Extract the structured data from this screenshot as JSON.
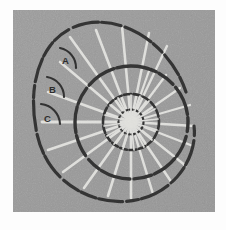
{
  "figure": {
    "kind": "scientific-line-figure",
    "canvas": {
      "width": 226,
      "height": 230
    },
    "plate": {
      "x": 13,
      "y": 10,
      "width": 202,
      "height": 202,
      "fill": "#9a9a9a",
      "border_color": "#fdfdfd",
      "texture": "film-grain"
    },
    "colors": {
      "background": "#fdfdfd",
      "plate_gray": "#9a9a9a",
      "plate_gray_light": "#a4a4a4",
      "plate_gray_dark": "#8e8e8e",
      "outline_dark": "#1a1a1a",
      "septa_white": "#f4f4f0",
      "arc_marker": "#131313",
      "label_text": "#0d0d0d"
    },
    "geometry": {
      "center_x": 131,
      "center_y": 122,
      "outer_whorl_radius": 56,
      "inner_whorl_radius": 28,
      "umbilicus_radius": 9,
      "aperture_extent_radius": 92
    }
  },
  "labels": [
    {
      "id": "A",
      "text": "A",
      "x": 63,
      "y": 60,
      "role": "angle-marker"
    },
    {
      "id": "B",
      "text": "B",
      "x": 50,
      "y": 89,
      "role": "angle-marker"
    },
    {
      "id": "C",
      "text": "C",
      "x": 45,
      "y": 119,
      "role": "angle-marker"
    }
  ],
  "angle_arcs": [
    {
      "id": "arc-A",
      "label": "A",
      "cx": 57,
      "cy": 67,
      "radius": 19,
      "start_deg": -74,
      "end_deg": 8
    },
    {
      "id": "arc-B",
      "label": "B",
      "cx": 45,
      "cy": 96,
      "radius": 19,
      "start_deg": -80,
      "end_deg": 4
    },
    {
      "id": "arc-C",
      "label": "C",
      "cx": 40,
      "cy": 124,
      "radius": 20,
      "start_deg": -86,
      "end_deg": 0
    }
  ],
  "septa": {
    "description": "white radial lines (septa) running from umbilicus to shell wall",
    "count": 22,
    "angles_deg": [
      -108,
      -96,
      -84,
      -72,
      -60,
      -48,
      -36,
      -24,
      -12,
      0,
      12,
      24,
      36,
      48,
      60,
      72,
      84,
      96,
      108,
      120,
      132,
      144
    ]
  },
  "inner_septa": {
    "description": "short white radial lines inside the inner whorl",
    "count": 26
  },
  "spiral_outline": {
    "description": "dark logarithmic spiral shell wall, broken / dashed appearance",
    "style": "dashed-irregular"
  }
}
